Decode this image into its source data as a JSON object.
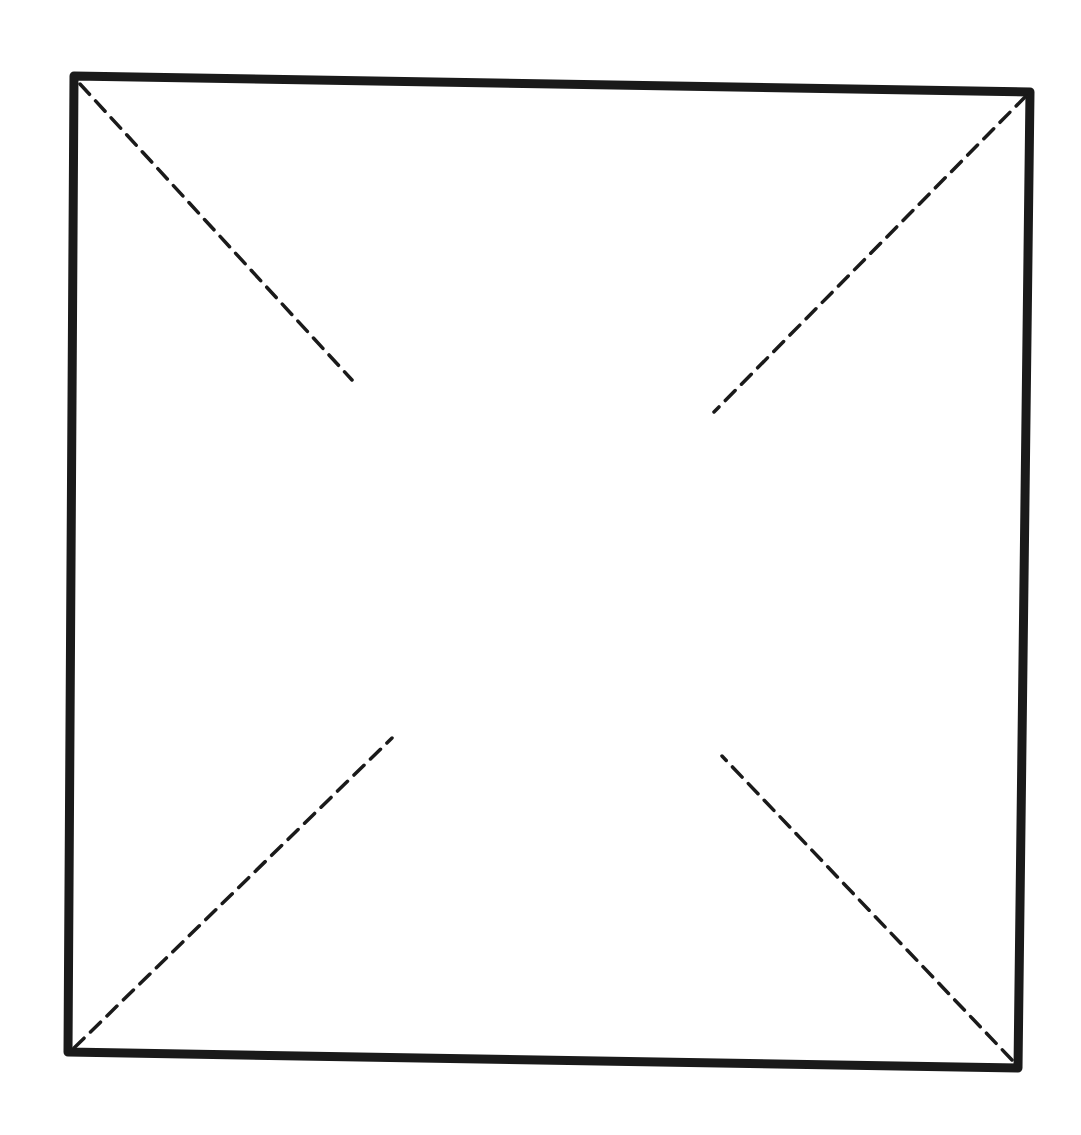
{
  "diagram": {
    "type": "square-with-corner-diagonals",
    "colors": {
      "stroke": "#1a1a1a",
      "background": "#ffffff"
    },
    "square": {
      "corners": {
        "top_left": [
          74,
          76
        ],
        "top_right": [
          1030,
          92
        ],
        "bottom_right": [
          1018,
          1068
        ],
        "bottom_left": [
          68,
          1052
        ]
      },
      "stroke_width": 9
    },
    "diagonals": [
      {
        "name": "top-left",
        "from": [
          80,
          84
        ],
        "to": [
          352,
          380
        ]
      },
      {
        "name": "top-right",
        "from": [
          1026,
          96
        ],
        "to": [
          714,
          412
        ]
      },
      {
        "name": "bottom-left",
        "from": [
          74,
          1048
        ],
        "to": [
          392,
          738
        ]
      },
      {
        "name": "bottom-right",
        "from": [
          1012,
          1060
        ],
        "to": [
          722,
          756
        ]
      }
    ],
    "dash_pattern": [
      14,
      9
    ],
    "dash_width": 3.5
  }
}
